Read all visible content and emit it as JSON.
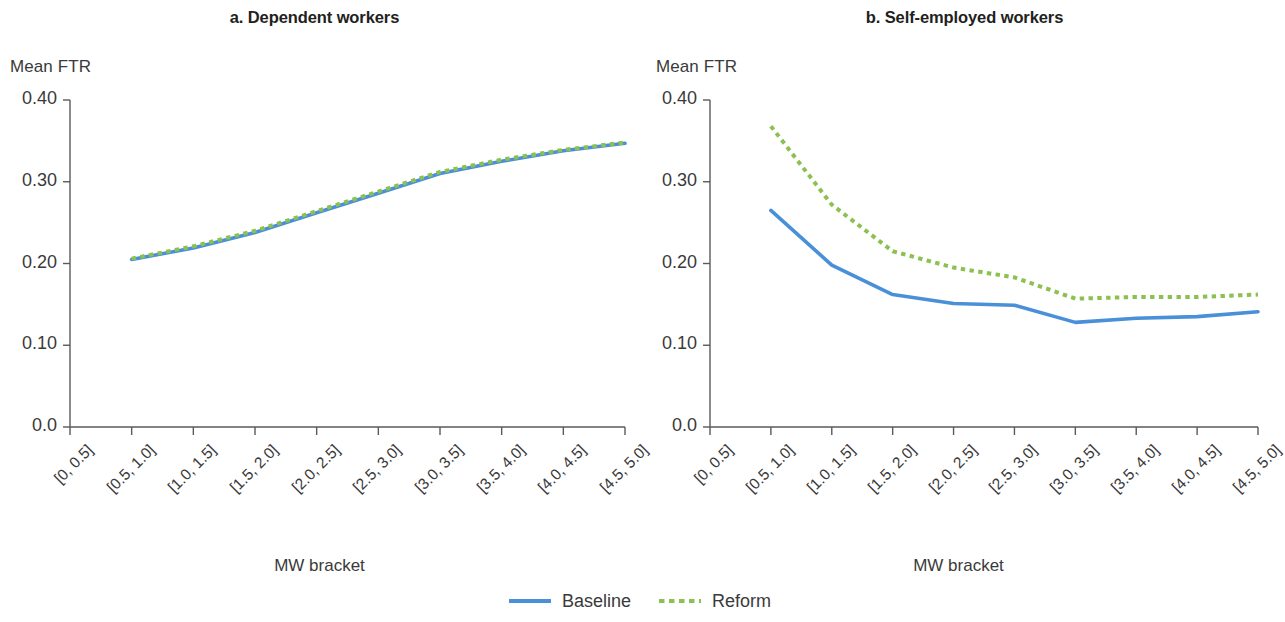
{
  "chart_data": [
    {
      "type": "line",
      "title": "a. Dependent workers",
      "xlabel": "MW bracket",
      "ylabel": "Mean FTR",
      "ylim": [
        0.0,
        0.4
      ],
      "yticks": [
        0.0,
        0.1,
        0.2,
        0.3,
        0.4
      ],
      "ytick_labels": [
        "0.0",
        "0.10",
        "0.20",
        "0.30",
        "0.40"
      ],
      "grid": false,
      "legend_position": "bottom-center-shared",
      "categories": [
        "[0, 0.5]",
        "[0.5, 1.0]",
        "[1.0, 1.5]",
        "[1.5, 2.0]",
        "[2.0, 2.5]",
        "[2.5, 3.0]",
        "[3.0, 3.5]",
        "[3.5, 4.0]",
        "[4.0, 4.5]",
        "[4.5, 5.0]"
      ],
      "series": [
        {
          "name": "Baseline",
          "color": "#4A90D9",
          "style": "solid",
          "values": [
            null,
            0.205,
            0.219,
            0.238,
            0.262,
            0.286,
            0.31,
            0.325,
            0.338,
            0.347
          ]
        },
        {
          "name": "Reform",
          "color": "#8CC152",
          "style": "dotted",
          "values": [
            null,
            0.206,
            0.221,
            0.24,
            0.264,
            0.288,
            0.312,
            0.327,
            0.339,
            0.348
          ]
        }
      ]
    },
    {
      "type": "line",
      "title": "b. Self-employed workers",
      "xlabel": "MW bracket",
      "ylabel": "Mean FTR",
      "ylim": [
        0.0,
        0.4
      ],
      "yticks": [
        0.0,
        0.1,
        0.2,
        0.3,
        0.4
      ],
      "ytick_labels": [
        "0.0",
        "0.10",
        "0.20",
        "0.30",
        "0.40"
      ],
      "grid": false,
      "legend_position": "bottom-center-shared",
      "categories": [
        "[0, 0.5]",
        "[0.5, 1.0]",
        "[1.0, 1.5]",
        "[1.5, 2.0]",
        "[2.0, 2.5]",
        "[2.5, 3.0]",
        "[3.0, 3.5]",
        "[3.5, 4.0]",
        "[4.0, 4.5]",
        "[4.5, 5.0]"
      ],
      "series": [
        {
          "name": "Baseline",
          "color": "#4A90D9",
          "style": "solid",
          "values": [
            null,
            0.265,
            0.198,
            0.162,
            0.151,
            0.149,
            0.128,
            0.133,
            0.135,
            0.141
          ]
        },
        {
          "name": "Reform",
          "color": "#8CC152",
          "style": "dotted",
          "values": [
            null,
            0.368,
            0.272,
            0.215,
            0.195,
            0.183,
            0.157,
            0.159,
            0.159,
            0.162
          ]
        }
      ]
    }
  ],
  "panels": {
    "a": {
      "title": "a. Dependent workers",
      "ylabel": "Mean FTR",
      "xlabel": "MW bracket",
      "ytick_labels": [
        "0.40",
        "0.30",
        "0.20",
        "0.10",
        "0.0"
      ],
      "xtick_labels": [
        "[0, 0.5]",
        "[0.5, 1.0]",
        "[1.0, 1.5]",
        "[1.5, 2.0]",
        "[2.0, 2.5]",
        "[2.5, 3.0]",
        "[3.0, 3.5]",
        "[3.5, 4.0]",
        "[4.0, 4.5]",
        "[4.5, 5.0]"
      ]
    },
    "b": {
      "title": "b. Self-employed workers",
      "ylabel": "Mean FTR",
      "xlabel": "MW bracket",
      "ytick_labels": [
        "0.40",
        "0.30",
        "0.20",
        "0.10",
        "0.0"
      ],
      "xtick_labels": [
        "[0, 0.5]",
        "[0.5, 1.0]",
        "[1.0, 1.5]",
        "[1.5, 2.0]",
        "[2.0, 2.5]",
        "[2.5, 3.0]",
        "[3.0, 3.5]",
        "[3.5, 4.0]",
        "[4.0, 4.5]",
        "[4.5, 5.0]"
      ]
    }
  },
  "legend": {
    "baseline_label": "Baseline",
    "reform_label": "Reform"
  },
  "colors": {
    "baseline": "#4A90D9",
    "reform": "#8CC152",
    "axis": "#5a5a5a",
    "text": "#3a3a3a"
  }
}
